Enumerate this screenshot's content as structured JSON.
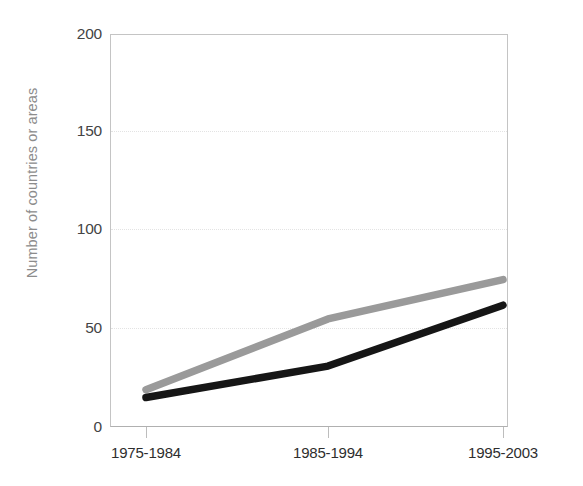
{
  "chart_data": {
    "type": "line",
    "title": "",
    "xlabel": "",
    "ylabel": "Number of countries or areas",
    "categories": [
      "1975-1984",
      "1985-1994",
      "1995-2003"
    ],
    "ylim": [
      0,
      200
    ],
    "yticks": [
      0,
      50,
      100,
      150,
      200
    ],
    "ytick_labels": [
      "0",
      "50",
      "100",
      "150",
      "200"
    ],
    "gridlines": {
      "horizontal": true,
      "vertical": false,
      "style": "dotted",
      "at": [
        50,
        100,
        150
      ]
    },
    "legend": {
      "visible": false,
      "position": "none"
    },
    "series": [
      {
        "name": "series-gray",
        "color": "#9a9a9a",
        "values": [
          19,
          55,
          75
        ]
      },
      {
        "name": "series-black",
        "color": "#161616",
        "values": [
          15,
          31,
          62
        ]
      }
    ]
  },
  "axes": {
    "y_title": "Number of countries or areas",
    "y_tick_labels": [
      "200",
      "150",
      "100",
      "50",
      "0"
    ],
    "x_tick_labels": [
      "1975-1984",
      "1985-1994",
      "1995-2003"
    ]
  },
  "colors": {
    "series_gray": "#9a9a9a",
    "series_black": "#161616",
    "gridline": "#e3e3e3",
    "frame": "#c4c4c4",
    "axis_label": "#8c8c8c",
    "tick_text": "#333333",
    "background": "#ffffff"
  },
  "title_stub": ""
}
